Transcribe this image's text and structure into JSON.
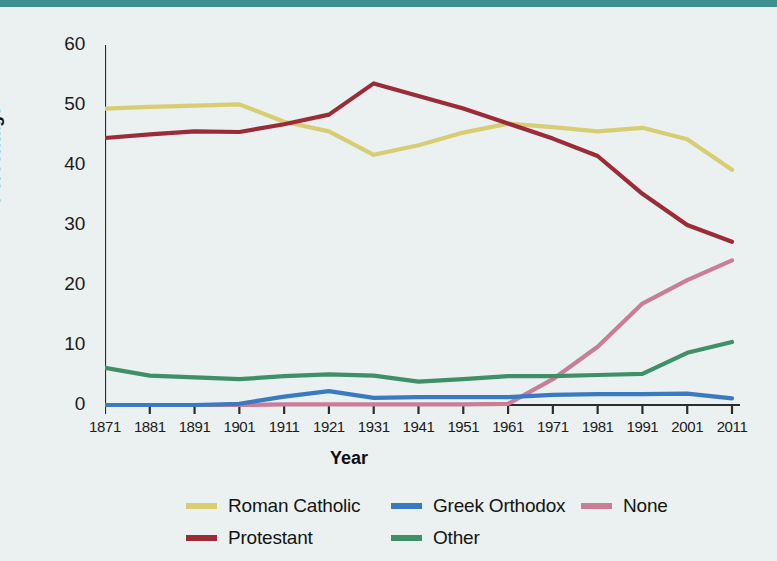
{
  "figure": {
    "background_color": "#eaf1f0",
    "rule_color": "#3f8f8c"
  },
  "chart_data": {
    "type": "line",
    "title": "",
    "xlabel": "Year",
    "ylabel": "Percentage",
    "x": [
      1871,
      1881,
      1891,
      1901,
      1911,
      1921,
      1931,
      1941,
      1951,
      1961,
      1971,
      1981,
      1991,
      2001,
      2011
    ],
    "xtick_labels": [
      "1871",
      "1881",
      "1891",
      "1901",
      "1911",
      "1921",
      "1931",
      "1941",
      "1951",
      "1961",
      "1971",
      "1981",
      "1991",
      "2001",
      "2011"
    ],
    "ytick_labels": [
      "0",
      "10",
      "20",
      "30",
      "40",
      "50",
      "60"
    ],
    "yticks": [
      0,
      10,
      20,
      30,
      40,
      50,
      60
    ],
    "xlim": [
      1871,
      2011
    ],
    "ylim": [
      0,
      60
    ],
    "grid": false,
    "legend_position": "bottom",
    "series": [
      {
        "name": "Roman Catholic",
        "color": "#d8cd73",
        "values": [
          49.4,
          49.7,
          49.9,
          50.1,
          47.2,
          45.6,
          41.7,
          43.3,
          45.4,
          46.9,
          46.3,
          45.6,
          46.2,
          44.3,
          39.2
        ]
      },
      {
        "name": "Protestant",
        "color": "#9c2b38",
        "values": [
          44.5,
          45.1,
          45.6,
          45.5,
          46.8,
          48.4,
          53.6,
          51.5,
          49.4,
          46.9,
          44.4,
          41.5,
          35.2,
          30.0,
          27.2
        ]
      },
      {
        "name": "Greek Orthodox",
        "color": "#3a7ac0",
        "values": [
          0.0,
          0.0,
          0.0,
          0.2,
          1.4,
          2.3,
          1.2,
          1.3,
          1.3,
          1.3,
          1.7,
          1.8,
          1.8,
          1.9,
          1.1
        ]
      },
      {
        "name": "Other",
        "color": "#3f8f68",
        "values": [
          6.2,
          4.9,
          4.6,
          4.3,
          4.8,
          5.1,
          4.9,
          3.9,
          4.3,
          4.8,
          4.8,
          5.0,
          5.2,
          8.7,
          10.5
        ]
      },
      {
        "name": "None",
        "color": "#ca7e96",
        "values": [
          0.0,
          0.0,
          0.0,
          0.0,
          0.1,
          0.1,
          0.1,
          0.1,
          0.1,
          0.2,
          4.3,
          9.7,
          16.9,
          20.8,
          24.1
        ]
      }
    ]
  },
  "legend": {
    "rows": [
      [
        {
          "label": "Roman Catholic",
          "color": "#d8cd73"
        },
        {
          "label": "Greek Orthodox",
          "color": "#3a7ac0"
        },
        {
          "label": "None",
          "color": "#ca7e96"
        }
      ],
      [
        {
          "label": "Protestant",
          "color": "#9c2b38"
        },
        {
          "label": "Other",
          "color": "#3f8f68"
        }
      ]
    ]
  }
}
